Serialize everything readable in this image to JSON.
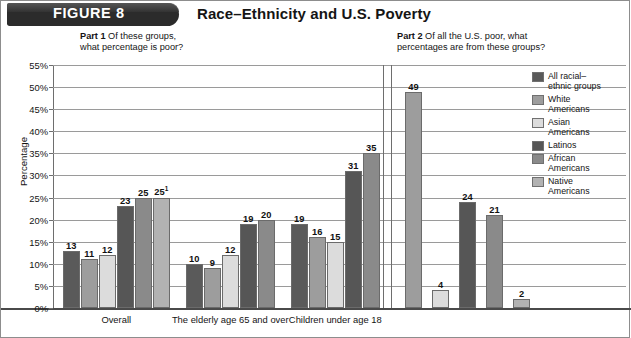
{
  "header": {
    "figure_label": "FIGURE 8",
    "title": "Race–Ethnicity and U.S. Poverty",
    "pill_color": "#2b2b2b"
  },
  "captions": {
    "part1": "Part 1  Of these groups,\nwhat percentage is poor?",
    "part1_bold": "Part 1",
    "part2": "Part 2  Of all the U.S. poor, what\npercentages are from these groups?",
    "part2_bold": "Part 2"
  },
  "legend": {
    "items": [
      {
        "label": "All racial–\nethnic groups",
        "color": "#5a5a5a"
      },
      {
        "label": "White\nAmericans",
        "color": "#9d9d9d"
      },
      {
        "label": "Asian\nAmericans",
        "color": "#dcdcdc"
      },
      {
        "label": "Latinos",
        "color": "#565656"
      },
      {
        "label": "African\nAmericans",
        "color": "#8a8a8a"
      },
      {
        "label": "Native\nAmericans",
        "color": "#b2b2b2"
      }
    ]
  },
  "chart_data": {
    "type": "bar",
    "title": "Race–Ethnicity and U.S. Poverty",
    "xlabel": "",
    "ylabel": "Percentage",
    "ylim": [
      0,
      55
    ],
    "ytick_step": 5,
    "yticks": [
      "0%",
      "5%",
      "10%",
      "15%",
      "20%",
      "25%",
      "30%",
      "35%",
      "40%",
      "45%",
      "50%",
      "55%"
    ],
    "grid": true,
    "legend_position": "right",
    "series_names": [
      "All racial–ethnic groups",
      "White Americans",
      "Asian Americans",
      "Latinos",
      "African Americans",
      "Native Americans"
    ],
    "panels": [
      {
        "name": "part1",
        "caption": "Part 1  Of these groups, what percentage is poor?",
        "categories": [
          "Overall",
          "The elderly\nage 65 and over",
          "Children\nunder age 18"
        ],
        "groups": [
          {
            "category": "Overall",
            "bars": [
              {
                "series": "All racial–ethnic groups",
                "value": 13,
                "label": "13"
              },
              {
                "series": "White Americans",
                "value": 11,
                "label": "11"
              },
              {
                "series": "Asian Americans",
                "value": 12,
                "label": "12"
              },
              {
                "series": "Latinos",
                "value": 23,
                "label": "23"
              },
              {
                "series": "African Americans",
                "value": 25,
                "label": "25"
              },
              {
                "series": "Native Americans",
                "value": 25,
                "label": "25",
                "footnote": "1"
              }
            ]
          },
          {
            "category": "The elderly age 65 and over",
            "bars": [
              {
                "series": "All racial–ethnic groups",
                "value": 10,
                "label": "10"
              },
              {
                "series": "White Americans",
                "value": 9,
                "label": "9"
              },
              {
                "series": "Asian Americans",
                "value": 12,
                "label": "12"
              },
              {
                "series": "Latinos",
                "value": 19,
                "label": "19"
              },
              {
                "series": "African Americans",
                "value": 20,
                "label": "20"
              }
            ]
          },
          {
            "category": "Children under age 18",
            "bars": [
              {
                "series": "All racial–ethnic groups",
                "value": 19,
                "label": "19"
              },
              {
                "series": "White Americans",
                "value": 16,
                "label": "16"
              },
              {
                "series": "Asian Americans",
                "value": 15,
                "label": "15"
              },
              {
                "series": "Latinos",
                "value": 31,
                "label": "31"
              },
              {
                "series": "African Americans",
                "value": 35,
                "label": "35"
              }
            ]
          }
        ]
      },
      {
        "name": "part2",
        "caption": "Part 2  Of all the U.S. poor, what percentages are from these groups?",
        "categories": [
          ""
        ],
        "groups": [
          {
            "category": "",
            "bars": [
              {
                "series": "White Americans",
                "value": 49,
                "label": "49"
              },
              {
                "series": "Asian Americans",
                "value": 4,
                "label": "4"
              },
              {
                "series": "Latinos",
                "value": 24,
                "label": "24"
              },
              {
                "series": "African Americans",
                "value": 21,
                "label": "21"
              },
              {
                "series": "Native Americans",
                "value": 2,
                "label": "2"
              }
            ]
          }
        ]
      }
    ]
  }
}
